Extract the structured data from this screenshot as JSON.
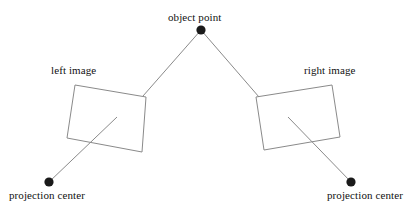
{
  "figure": {
    "type": "diagram",
    "background_color": "#ffffff",
    "line_color": "#8a8a8a",
    "marker_color": "#1a1a1a",
    "text_color": "#111111",
    "width": 416,
    "height": 213
  },
  "labels": {
    "object_point": "object point",
    "left_image": "left image",
    "right_image": "right image",
    "projection_center_left": "projection center",
    "projection_center_right": "projection center"
  },
  "geometry": {
    "object_point": {
      "x": 201,
      "y": 30,
      "r": 4.6
    },
    "projection_center_left": {
      "x": 49,
      "y": 182,
      "r": 4.6
    },
    "projection_center_right": {
      "x": 351,
      "y": 182,
      "r": 4.6
    },
    "left_image_plane": {
      "corners": [
        {
          "x": 75,
          "y": 85
        },
        {
          "x": 146,
          "y": 97
        },
        {
          "x": 142,
          "y": 152
        },
        {
          "x": 67,
          "y": 138
        }
      ]
    },
    "right_image_plane": {
      "corners": [
        {
          "x": 256,
          "y": 97
        },
        {
          "x": 332,
          "y": 85
        },
        {
          "x": 340,
          "y": 137
        },
        {
          "x": 264,
          "y": 150
        }
      ]
    },
    "ray_object_to_left_image": {
      "x1": 201,
      "y1": 30,
      "x2": 143,
      "y2": 96
    },
    "ray_object_to_right_image": {
      "x1": 201,
      "y1": 30,
      "x2": 259,
      "y2": 97
    },
    "ray_left_center_to_image": {
      "x1": 49,
      "y1": 182,
      "x2": 117,
      "y2": 117
    },
    "ray_right_center_to_image": {
      "x1": 351,
      "y1": 182,
      "x2": 288,
      "y2": 117
    }
  }
}
